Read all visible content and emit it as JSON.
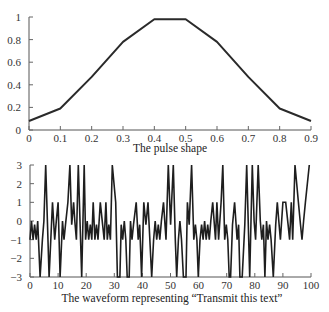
{
  "chart_data": [
    {
      "type": "line",
      "title": "",
      "caption": "The pulse shape",
      "xlabel": "The pulse shape",
      "ylabel": "",
      "x": [
        0,
        0.1,
        0.2,
        0.3,
        0.4,
        0.5,
        0.6,
        0.7,
        0.8,
        0.9
      ],
      "values": [
        0.08,
        0.19,
        0.47,
        0.78,
        0.98,
        0.98,
        0.78,
        0.47,
        0.19,
        0.08
      ],
      "xlim": [
        0,
        0.9
      ],
      "ylim": [
        0,
        1
      ],
      "xticks": [
        "0",
        "0.1",
        "0.2",
        "0.3",
        "0.4",
        "0.5",
        "0.6",
        "0.7",
        "0.8",
        "0.9"
      ],
      "yticks": [
        "0",
        "0.2",
        "0.4",
        "0.6",
        "0.8",
        "1"
      ],
      "grid": false,
      "legend": null
    },
    {
      "type": "line",
      "title": "",
      "caption": "The waveform representing “Transmit this text”",
      "xlabel": "The waveform representing “Transmit this text”",
      "ylabel": "",
      "xlim": [
        0,
        100
      ],
      "ylim": [
        -3,
        3
      ],
      "xticks": [
        "0",
        "10",
        "20",
        "30",
        "40",
        "50",
        "60",
        "70",
        "80",
        "90",
        "100"
      ],
      "yticks": [
        "−3",
        "−2",
        "−1",
        "0",
        "1",
        "2",
        "3"
      ],
      "grid": false,
      "legend": null,
      "peaks_at_plus3": [
        5.6,
        14.2,
        17.2,
        19.3,
        29.3,
        49.2,
        51.0,
        57.5,
        68.6,
        77.1,
        79.1,
        81.2,
        94.3,
        99.4
      ],
      "troughs_at_minus3": [
        3.6,
        6.8,
        10.7,
        18.4,
        31.1,
        32.0,
        34.6,
        35.3,
        39.7,
        43.3,
        52.2,
        54.6,
        55.5,
        59.9,
        70.9,
        71.4,
        74.7,
        75.5,
        78.2,
        83.6,
        86.6
      ],
      "plus1_bumps": [
        8,
        10,
        13.5,
        15.5,
        22.5,
        25,
        27,
        30.5,
        37.8,
        40.5,
        42,
        47.5,
        56,
        65,
        66.5,
        68,
        72.8,
        88,
        90,
        91,
        93,
        95.5,
        98
      ],
      "baseline_note": "signal oscillates mostly between -1 and 0 between large excursions"
    }
  ]
}
